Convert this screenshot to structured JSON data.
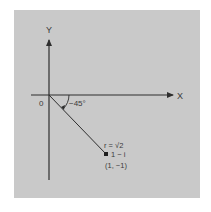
{
  "diagram": {
    "type": "complex-plane-polar",
    "colors": {
      "panel": "#c9c9c9",
      "background": "#ffffff",
      "ink": "#2e2e2e"
    },
    "axes": {
      "x_label": "X",
      "y_label": "Y",
      "origin_label": "0"
    },
    "angle": {
      "label": "−45°",
      "degrees": -45
    },
    "point": {
      "radius_label": "r = √2",
      "complex_label": "1 − i",
      "coordinate_label": "(1, −1)",
      "re": 1,
      "im": -1
    }
  }
}
